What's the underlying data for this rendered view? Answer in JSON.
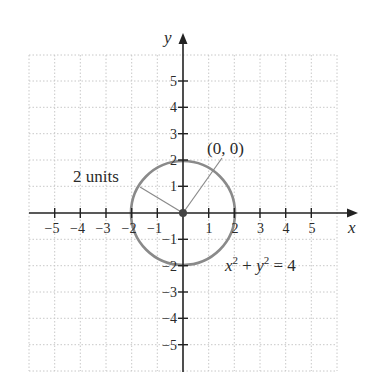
{
  "diagram": {
    "type": "circle-on-coordinate-plane",
    "x_axis": {
      "label": "x",
      "tick_values": [
        -5,
        -4,
        -3,
        -2,
        -1,
        1,
        2,
        3,
        4,
        5
      ],
      "tick_labels": [
        "−5",
        "−4",
        "−3",
        "−2",
        "−1",
        "1",
        "2",
        "3",
        "4",
        "5"
      ]
    },
    "y_axis": {
      "label": "y",
      "tick_values": [
        5,
        4,
        3,
        2,
        1,
        -1,
        -2,
        -3,
        -4,
        -5
      ],
      "tick_labels": [
        "5",
        "4",
        "3",
        "2",
        "1",
        "−1",
        "−2",
        "−3",
        "−4",
        "−5"
      ]
    },
    "grid": {
      "visible": true,
      "style": "dotted",
      "range": [
        -6,
        6
      ]
    },
    "circle": {
      "center": [
        0,
        0
      ],
      "radius": 2,
      "equation_parts": {
        "x": "x",
        "sup1": "2",
        "plus": " + ",
        "y": "y",
        "sup2": "2",
        "equals": " = 4"
      }
    },
    "annotations": {
      "center_label": "(0, 0)",
      "radius_label": "2 units"
    },
    "colors": {
      "axis": "#222222",
      "circle": "#8a8a8a",
      "grid": "#c8c8c8",
      "point": "#444444",
      "text": "#2a2a2a"
    }
  }
}
